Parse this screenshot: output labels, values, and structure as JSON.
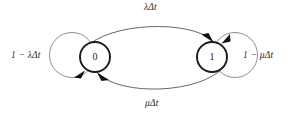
{
  "diagram": {
    "type": "markov-chain-state-transition-diagram",
    "states": [
      {
        "id": "state-0",
        "label": "0",
        "cx": 95,
        "cy": 57,
        "r": 15
      },
      {
        "id": "state-1",
        "label": "1",
        "cx": 212,
        "cy": 57,
        "r": 15
      }
    ],
    "transitions": [
      {
        "id": "zero-to-one",
        "from": "0",
        "to": "1",
        "label_prefix": "",
        "label_var": "λΔt",
        "label_full": "λΔt",
        "position": "top"
      },
      {
        "id": "one-to-zero",
        "from": "1",
        "to": "0",
        "label_prefix": "",
        "label_var": "μΔt",
        "label_full": "μΔt",
        "position": "bottom"
      },
      {
        "id": "zero-self-loop",
        "from": "0",
        "to": "0",
        "label_prefix": "1 − ",
        "label_var": "λΔt",
        "label_full": "1 − λΔt",
        "position": "left"
      },
      {
        "id": "one-self-loop",
        "from": "1",
        "to": "1",
        "label_prefix": "1 − ",
        "label_var": "μΔt",
        "label_full": "1 − μΔt",
        "position": "right"
      }
    ],
    "colors": {
      "state_stroke": "#1a1a1a",
      "self_loop_stroke": "#7a7a7a",
      "transition_stroke": "#555555",
      "arrowhead_fill": "#111111",
      "background": "#ffffff",
      "text": "#2b2b2b"
    }
  }
}
